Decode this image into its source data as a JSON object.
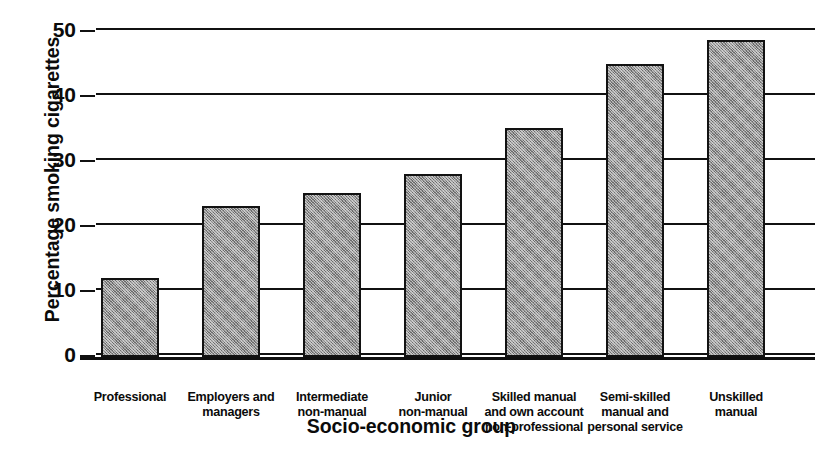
{
  "chart_data": {
    "type": "bar",
    "title": "",
    "xlabel": "Socio-economic group",
    "ylabel": "Percentage smoking cigarettes",
    "categories": [
      "Professional",
      "Employers and managers",
      "Intermediate non-manual",
      "Junior non-manual",
      "Skilled manual and own account non-professional",
      "Semi-skilled manual and personal service",
      "Unskilled manual"
    ],
    "category_lines": [
      [
        "Professional"
      ],
      [
        "Employers and",
        "managers"
      ],
      [
        "Intermediate",
        "non-manual"
      ],
      [
        "Junior",
        "non-manual"
      ],
      [
        "Skilled manual",
        "and own account",
        "non-professional"
      ],
      [
        "Semi-skilled",
        "manual and",
        "personal service"
      ],
      [
        "Unskilled",
        "manual"
      ]
    ],
    "values": [
      12,
      23,
      25,
      27.8,
      34.8,
      44.6,
      48.2
    ],
    "ylim": [
      0,
      50
    ],
    "yticks": [
      0,
      10,
      20,
      30,
      40,
      50
    ],
    "ytick_labels": [
      "0",
      "10",
      "20",
      "30",
      "40",
      "50"
    ],
    "grid": true,
    "grid_axis": "y",
    "legend": false,
    "bar_fill_color": "#8f8f8f",
    "bar_edge_color": "#121212",
    "background_color": "#ffffff",
    "text_color": "#0b0b0b"
  }
}
